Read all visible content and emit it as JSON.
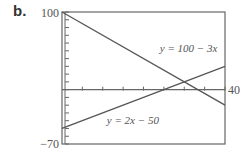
{
  "panel_label": "b.",
  "chart_data": {
    "type": "line",
    "title": "",
    "xlabel": "",
    "ylabel": "",
    "xlim": [
      0,
      40
    ],
    "ylim": [
      -70,
      100
    ],
    "x_tick_step": 5,
    "y_tick_step": 10,
    "tick_labels": {
      "y_top": "100",
      "y_bottom": "−70",
      "x_right": "40"
    },
    "grid": false,
    "series": [
      {
        "name": "y = 100 − 3x",
        "x": [
          0,
          40
        ],
        "values": [
          100,
          -20
        ]
      },
      {
        "name": "y = 2x − 50",
        "x": [
          0,
          40
        ],
        "values": [
          -50,
          30
        ]
      }
    ],
    "annotations": [
      {
        "text": "y = 100 − 3x",
        "x": 24,
        "y": 49
      },
      {
        "text": "y = 2x − 50",
        "x": 11,
        "y": -44
      }
    ]
  },
  "colors": {
    "line": "#555555",
    "frame": "#666666",
    "text": "#555555"
  }
}
